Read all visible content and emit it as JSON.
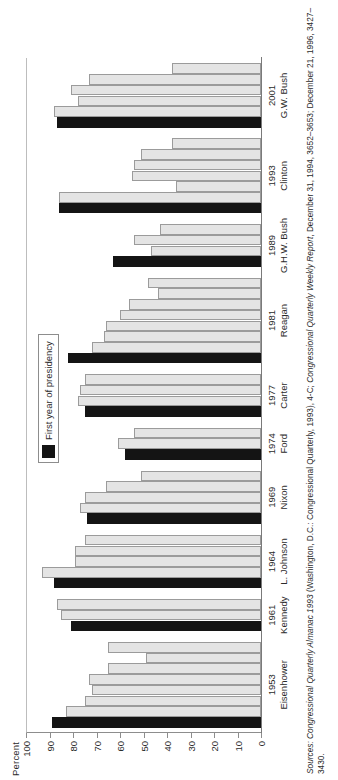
{
  "figure": {
    "axis_title": "Percent",
    "legend_label": "First year of presidency",
    "legend_color": "#141414",
    "bar_color": "#e4e4e4",
    "bar_border_color": "#9b9b9b"
  },
  "source": {
    "label": "Sources:",
    "text_1": "Congressional Quarterly Almanac 1993",
    "text_2": " (Washington, D.C.: Congressional Quarterly, 1993), 4-C; ",
    "text_3": "Congressional Quarterly Weekly Report",
    "text_4": ", December 31, 1994, 3652–3653; December 21, 1996, 3427–3430."
  },
  "chart_data": {
    "type": "bar",
    "title": "",
    "xlabel": "",
    "ylabel": "Percent",
    "ylim": [
      0,
      100
    ],
    "yticks": [
      100,
      90,
      80,
      70,
      60,
      50,
      40,
      30,
      20,
      10,
      0
    ],
    "grid": false,
    "legend_position": "inside-upper-center",
    "legend_entries": [
      "First year of presidency"
    ],
    "orientation": "rotated-horizontal-bars",
    "note": "Each group is one presidency; the first (black) bar is the president's first year in office, the remaining gray bars are the following years in sequence.",
    "groups": [
      {
        "year": "1953",
        "president": "Eisenhower",
        "values": [
          89,
          83,
          75,
          72,
          73,
          65,
          49,
          65
        ]
      },
      {
        "year": "1961",
        "president": "Kennedy",
        "values": [
          81,
          85,
          87
        ]
      },
      {
        "year": "1964",
        "president": "L. Johnson",
        "values": [
          88,
          93,
          79,
          79,
          75
        ]
      },
      {
        "year": "1969",
        "president": "Nixon",
        "values": [
          74,
          77,
          75,
          66,
          51
        ]
      },
      {
        "year": "1974",
        "president": "Ford",
        "values": [
          58,
          61,
          54
        ]
      },
      {
        "year": "1977",
        "president": "Carter",
        "values": [
          75,
          78,
          77,
          75
        ]
      },
      {
        "year": "1981",
        "president": "Reagan",
        "values": [
          82,
          72,
          67,
          66,
          60,
          56,
          44,
          48
        ]
      },
      {
        "year": "1989",
        "president": "G.H.W. Bush",
        "values": [
          63,
          47,
          54,
          43
        ]
      },
      {
        "year": "1993",
        "president": "Clinton",
        "values": [
          86,
          86,
          36,
          55,
          54,
          51,
          38
        ]
      },
      {
        "year": "2001",
        "president": "G.W. Bush",
        "values": [
          87,
          88,
          78,
          81,
          73,
          38
        ]
      }
    ]
  }
}
